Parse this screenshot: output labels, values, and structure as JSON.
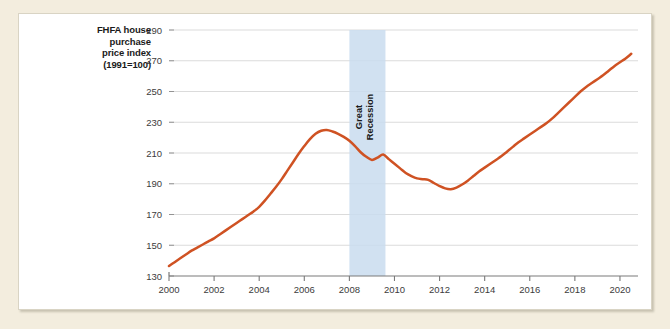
{
  "figure": {
    "background_color": "#f3edde",
    "panel_color": "#ffffff"
  },
  "axis_title": {
    "line1": "FHFA house",
    "line2": "purchase",
    "line3": "price index",
    "line4": "(1991=100)"
  },
  "annotation": {
    "great_recession_line1": "Great",
    "great_recession_line2": "Recession",
    "band_color": "#c9dcee",
    "band_start": 2008.0,
    "band_end": 2009.6
  },
  "chart_data": {
    "type": "line",
    "title": "",
    "xlabel": "",
    "ylabel": "FHFA house purchase price index (1991=100)",
    "line_color": "#cf5223",
    "grid": true,
    "legend_position": "none",
    "xlim": [
      2000,
      2020.8
    ],
    "ylim": [
      130,
      290
    ],
    "yticks": [
      130,
      150,
      170,
      190,
      210,
      230,
      250,
      270,
      290
    ],
    "xticks": [
      2000,
      2002,
      2004,
      2006,
      2008,
      2010,
      2012,
      2014,
      2016,
      2018,
      2020
    ],
    "xtick_labels": [
      "2000",
      "2002",
      "2004",
      "2006",
      "2008",
      "2010",
      "2012",
      "2014",
      "2016",
      "2018",
      "2020"
    ],
    "ytick_labels": [
      "130",
      "150",
      "170",
      "190",
      "210",
      "230",
      "250",
      "270",
      "290"
    ],
    "series": [
      {
        "name": "FHFA house purchase price index",
        "x": [
          2000.0,
          2000.25,
          2000.5,
          2000.75,
          2001.0,
          2001.25,
          2001.5,
          2001.75,
          2002.0,
          2002.25,
          2002.5,
          2002.75,
          2003.0,
          2003.25,
          2003.5,
          2003.75,
          2004.0,
          2004.25,
          2004.5,
          2004.75,
          2005.0,
          2005.25,
          2005.5,
          2005.75,
          2006.0,
          2006.25,
          2006.5,
          2006.75,
          2007.0,
          2007.25,
          2007.5,
          2007.75,
          2008.0,
          2008.25,
          2008.5,
          2008.75,
          2009.0,
          2009.25,
          2009.5,
          2009.75,
          2010.0,
          2010.25,
          2010.5,
          2010.75,
          2011.0,
          2011.25,
          2011.5,
          2011.75,
          2012.0,
          2012.25,
          2012.5,
          2012.75,
          2013.0,
          2013.25,
          2013.5,
          2013.75,
          2014.0,
          2014.25,
          2014.5,
          2014.75,
          2015.0,
          2015.25,
          2015.5,
          2015.75,
          2016.0,
          2016.25,
          2016.5,
          2016.75,
          2017.0,
          2017.25,
          2017.5,
          2017.75,
          2018.0,
          2018.25,
          2018.5,
          2018.75,
          2019.0,
          2019.25,
          2019.5,
          2019.75,
          2020.0,
          2020.25,
          2020.5
        ],
        "y": [
          136.5,
          139.0,
          141.5,
          144.0,
          146.5,
          148.5,
          150.5,
          152.5,
          154.5,
          157.0,
          159.5,
          162.0,
          164.5,
          167.0,
          169.5,
          172.0,
          175.0,
          179.0,
          183.5,
          188.0,
          193.0,
          198.5,
          204.0,
          209.5,
          214.5,
          219.0,
          222.5,
          224.5,
          225.0,
          224.0,
          222.5,
          220.5,
          218.0,
          214.5,
          210.5,
          207.5,
          205.5,
          207.0,
          209.0,
          206.0,
          203.0,
          200.0,
          197.0,
          195.0,
          193.5,
          193.0,
          192.5,
          190.5,
          188.5,
          187.0,
          186.5,
          187.5,
          189.5,
          192.0,
          195.0,
          198.0,
          200.5,
          203.0,
          205.5,
          208.0,
          211.0,
          214.0,
          217.0,
          219.5,
          222.0,
          224.5,
          227.0,
          229.5,
          232.5,
          236.0,
          239.5,
          243.0,
          246.5,
          250.0,
          253.0,
          255.5,
          258.0,
          260.5,
          263.5,
          266.5,
          269.0,
          271.5,
          274.5
        ]
      }
    ]
  }
}
